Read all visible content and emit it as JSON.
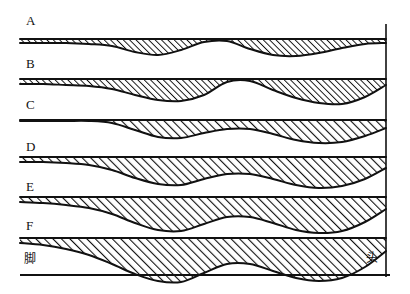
{
  "figure": {
    "title": "",
    "background_color": "#ffffff",
    "ink_color": "#111111",
    "width": 410,
    "height": 294,
    "band_labels": [
      {
        "id": "A",
        "text": "A",
        "x": 26,
        "y": 14
      },
      {
        "id": "B",
        "text": "B",
        "x": 26,
        "y": 57
      },
      {
        "id": "C",
        "text": "C",
        "x": 26,
        "y": 98
      },
      {
        "id": "D",
        "text": "D",
        "x": 26,
        "y": 140
      },
      {
        "id": "E",
        "text": "E",
        "x": 26,
        "y": 180
      },
      {
        "id": "F",
        "text": "F",
        "x": 26,
        "y": 219
      }
    ],
    "axis_labels": {
      "left": {
        "text": "脚",
        "x": 24,
        "y": 253
      },
      "right": {
        "text": "头",
        "x": 366,
        "y": 252
      }
    },
    "axis": {
      "baseline_y": 275,
      "baseline_x_start": 20,
      "baseline_x_end": 390,
      "right_rule_x": 386,
      "right_rule_y_top": 24,
      "right_rule_y_bottom": 277
    }
  },
  "chart_data": {
    "type": "area",
    "title": "",
    "subtitle": "",
    "xlabel": "",
    "ylabel": "",
    "grid": false,
    "legend_position": "none",
    "x_axis": {
      "left_end_label": "脚",
      "right_end_label": "头",
      "range_px": [
        20,
        386
      ],
      "note": "horizontal position along body from foot (left) to head (right)"
    },
    "ylim_px": [
      0,
      294
    ],
    "series": [
      {
        "name": "A",
        "top_y": 39,
        "baseline_y": 39,
        "thickness_px": [
          4,
          4,
          4,
          5,
          7,
          13,
          16,
          11,
          3,
          2,
          10,
          16,
          17,
          14,
          9,
          5,
          4
        ],
        "x_px": [
          20,
          43,
          66,
          89,
          112,
          135,
          158,
          181,
          204,
          227,
          250,
          273,
          296,
          319,
          342,
          365,
          386
        ]
      },
      {
        "name": "B",
        "top_y": 79,
        "baseline_y": 79,
        "thickness_px": [
          5,
          5,
          6,
          7,
          10,
          16,
          21,
          22,
          16,
          3,
          2,
          11,
          19,
          24,
          25,
          18,
          6
        ],
        "x_px": [
          20,
          43,
          66,
          89,
          112,
          135,
          158,
          181,
          204,
          227,
          250,
          273,
          296,
          319,
          342,
          365,
          386
        ]
      },
      {
        "name": "C",
        "top_y": 120,
        "baseline_y": 120,
        "thickness_px": [
          1,
          1,
          1,
          1,
          3,
          10,
          17,
          18,
          13,
          9,
          9,
          14,
          20,
          23,
          22,
          16,
          8
        ],
        "x_px": [
          20,
          43,
          66,
          89,
          112,
          135,
          158,
          181,
          204,
          227,
          250,
          273,
          296,
          319,
          342,
          365,
          386
        ]
      },
      {
        "name": "D",
        "top_y": 157,
        "baseline_y": 157,
        "thickness_px": [
          5,
          5,
          6,
          8,
          13,
          21,
          27,
          28,
          22,
          17,
          17,
          22,
          28,
          31,
          29,
          22,
          11
        ],
        "x_px": [
          20,
          43,
          66,
          89,
          112,
          135,
          158,
          181,
          204,
          227,
          250,
          273,
          296,
          319,
          342,
          365,
          386
        ]
      },
      {
        "name": "E",
        "top_y": 197,
        "baseline_y": 197,
        "thickness_px": [
          5,
          6,
          8,
          11,
          17,
          26,
          33,
          34,
          27,
          20,
          20,
          26,
          33,
          36,
          34,
          25,
          12
        ],
        "x_px": [
          20,
          43,
          66,
          89,
          112,
          135,
          158,
          181,
          204,
          227,
          250,
          273,
          296,
          319,
          342,
          365,
          386
        ]
      },
      {
        "name": "F",
        "top_y": 238,
        "baseline_y": 238,
        "thickness_px": [
          5,
          7,
          11,
          17,
          26,
          36,
          43,
          44,
          35,
          26,
          26,
          33,
          40,
          43,
          40,
          29,
          13
        ],
        "x_px": [
          20,
          43,
          66,
          89,
          112,
          135,
          158,
          181,
          204,
          227,
          250,
          273,
          296,
          319,
          342,
          365,
          386
        ]
      }
    ]
  }
}
